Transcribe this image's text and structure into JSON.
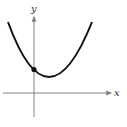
{
  "diagram": {
    "type": "parabola-graph",
    "x_axis_label": "x",
    "y_axis_label": "y",
    "colors": {
      "background": "#ffffff",
      "axis": "#808080",
      "curve": "#111111",
      "point": "#111111",
      "label": "#333333"
    },
    "curve": {
      "description": "upward-opening parabola with vertex right of y-axis, above x-axis",
      "marked_point": "y-intercept"
    }
  }
}
